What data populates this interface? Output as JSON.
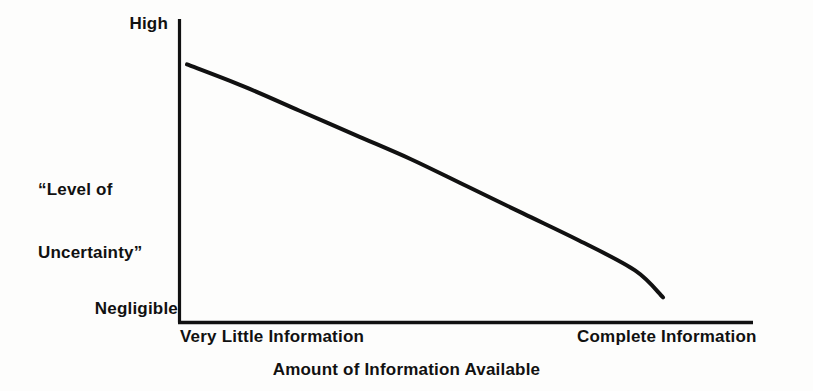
{
  "figure": {
    "background_color": "#fdfdfc",
    "ink_color": "#111111"
  },
  "axes": {
    "y_title_line1": "“Level of",
    "y_title_line2": "Uncertainty”",
    "y_tick_high": "High",
    "y_tick_low": "Negligible",
    "x_tick_left": "Very Little Information",
    "x_tick_right": "Complete Information",
    "x_title": "Amount of Information Available"
  },
  "chart_data": {
    "type": "line",
    "title": "",
    "subtitle": "",
    "xlabel": "Amount of Information Available",
    "ylabel": "“Level of Uncertainty”",
    "grid": false,
    "legend": false,
    "legend_position": "none",
    "xlim": [
      0,
      1
    ],
    "ylim": [
      0,
      1
    ],
    "x_tick_labels": [
      "Very Little Information",
      "Complete Information"
    ],
    "x_tick_positions": [
      0,
      1
    ],
    "y_tick_labels": [
      "Negligible",
      "High"
    ],
    "y_tick_positions": [
      0,
      1
    ],
    "series": [
      {
        "name": "Level of Uncertainty",
        "color": "#111111",
        "line_width": 4,
        "x": [
          0.0,
          0.1,
          0.2,
          0.3,
          0.4,
          0.5,
          0.6,
          0.7,
          0.8,
          0.85
        ],
        "y": [
          0.91,
          0.83,
          0.74,
          0.65,
          0.56,
          0.46,
          0.36,
          0.26,
          0.15,
          0.05
        ]
      }
    ],
    "annotations": []
  }
}
